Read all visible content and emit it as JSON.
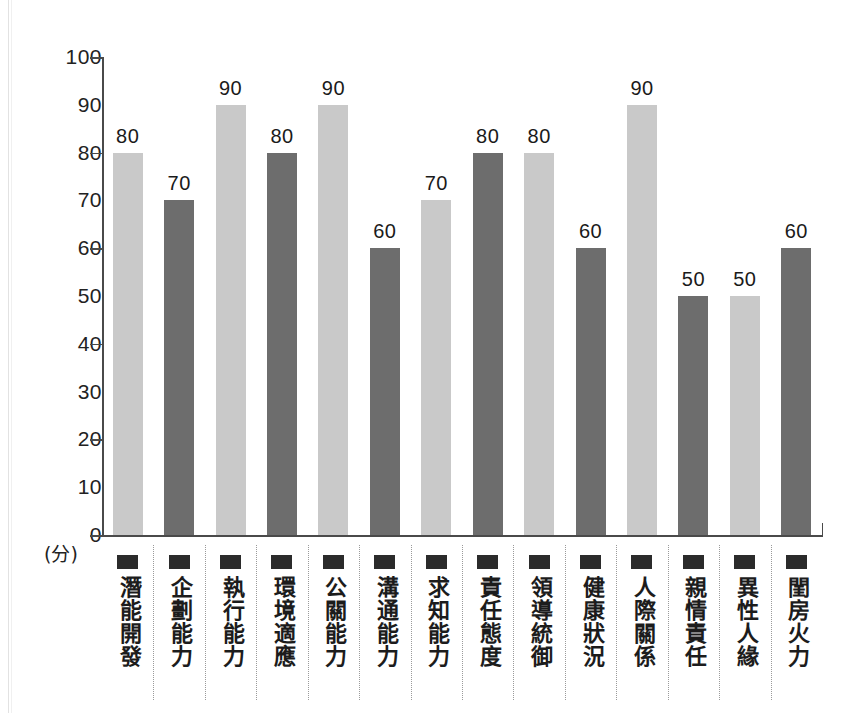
{
  "chart_data": {
    "type": "bar",
    "title": "",
    "xlabel": "",
    "ylabel": "",
    "unit_label": "(分)",
    "ylim": [
      0,
      100
    ],
    "ytick_step": 10,
    "ytick_labels": [
      "100",
      "90",
      "80",
      "70",
      "60",
      "50",
      "40",
      "30",
      "20",
      "10",
      "0"
    ],
    "ytick_marks_at": [
      100,
      80,
      60,
      40,
      20,
      0
    ],
    "grid": false,
    "legend": "none",
    "categories": [
      "潛能開發",
      "企劃能力",
      "執行能力",
      "環境適應",
      "公關能力",
      "溝通能力",
      "求知能力",
      "責任態度",
      "領導統御",
      "健康狀況",
      "人際關係",
      "親情責任",
      "異性人緣",
      "閨房火力"
    ],
    "values": [
      80,
      70,
      90,
      80,
      90,
      60,
      70,
      80,
      80,
      60,
      90,
      50,
      50,
      60
    ],
    "bar_shades": [
      "light",
      "dark",
      "light",
      "dark",
      "light",
      "dark",
      "light",
      "dark",
      "light",
      "dark",
      "light",
      "dark",
      "light",
      "dark"
    ],
    "colors": {
      "light_bar": "#c9c9c9",
      "dark_bar": "#6d6d6d",
      "axis": "#4a4a4a",
      "text": "#1a1a1a",
      "separator": "#9a9a9a",
      "marker": "#2b2b2b",
      "background": "#ffffff"
    }
  }
}
